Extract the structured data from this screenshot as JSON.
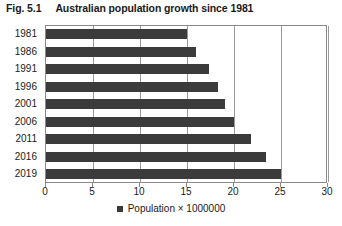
{
  "figure": {
    "number": "Fig. 5.1",
    "title": "Australian population growth since 1981"
  },
  "chart_data": {
    "type": "bar",
    "orientation": "horizontal",
    "title": "Australian population growth since 1981",
    "categories": [
      "1981",
      "1986",
      "1991",
      "1996",
      "2001",
      "2006",
      "2011",
      "2016",
      "2019"
    ],
    "values": [
      15.0,
      16.0,
      17.3,
      18.3,
      19.0,
      20.0,
      21.8,
      23.4,
      25.0
    ],
    "series": [
      {
        "name": "Population × 1000000",
        "values": [
          15.0,
          16.0,
          17.3,
          18.3,
          19.0,
          20.0,
          21.8,
          23.4,
          25.0
        ],
        "color": "#3b3b3b"
      }
    ],
    "xlabel": "",
    "ylabel": "",
    "xlim": [
      0,
      30
    ],
    "xticks": [
      0,
      5,
      10,
      15,
      20,
      25,
      30
    ],
    "xtick_labels": [
      "0",
      "5",
      "10",
      "15",
      "20",
      "25",
      "30"
    ],
    "grid": "vertical",
    "legend": {
      "position": "bottom",
      "entries": [
        {
          "label": "Population × 1000000",
          "color": "#3b3b3b",
          "marker": "square-marker"
        }
      ]
    },
    "colors": {
      "bar": "#3b3b3b",
      "grid": "#9a9a9a",
      "frame": "#8a8a8a",
      "text": "#1a1a1a",
      "background": "#ffffff"
    }
  }
}
